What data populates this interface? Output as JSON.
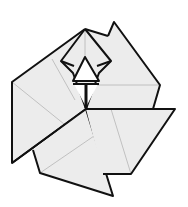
{
  "diagram": {
    "subject": "origami flower / pinwheel fold",
    "colors": {
      "paper": "#ececec",
      "outline": "#111111",
      "crease": "#b5b5b5",
      "background": "#ffffff",
      "center_triangle": "#ffffff"
    },
    "parts": [
      {
        "name": "top-kite",
        "label": "Top kite flap"
      },
      {
        "name": "center-triangle",
        "label": "Center white triangle"
      },
      {
        "name": "right-upper-flap",
        "label": "Right upper triangular flap"
      },
      {
        "name": "right-lower-flap",
        "label": "Right lower flap"
      },
      {
        "name": "bottom-flap",
        "label": "Bottom triangular flap"
      },
      {
        "name": "left-flap",
        "label": "Left flap"
      }
    ]
  }
}
